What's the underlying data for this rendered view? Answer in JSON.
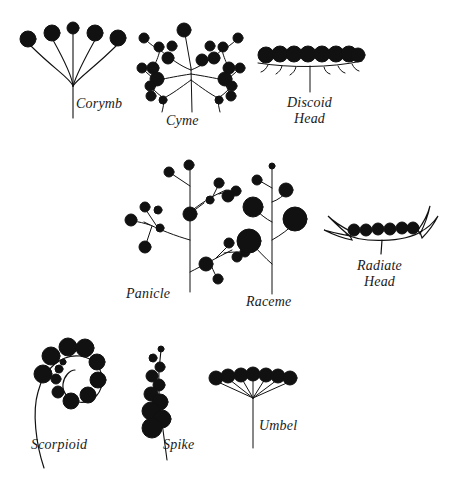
{
  "figure": {
    "width": 459,
    "height": 477,
    "background": "#ffffff",
    "ink": "#111111"
  },
  "labels": {
    "corymb": "Corymb",
    "cyme": "Cyme",
    "discoid_head": "Discoid\nHead",
    "panicle": "Panicle",
    "raceme": "Raceme",
    "radiate_head": "Radiate\nHead",
    "scorpioid": "Scorpioid",
    "spike": "Spike",
    "umbel": "Umbel"
  },
  "diagrams": [
    {
      "name": "corymb",
      "label": "Corymb",
      "description": "Flat-topped cluster; pedicels of unequal length arising at different points along the axis so all flowers reach nearly the same level.",
      "flower_count": 5,
      "axis": {
        "x": 73,
        "y_base": 118,
        "y_top": 78
      },
      "flowers": [
        {
          "cx": 28,
          "cy": 39,
          "r": 8
        },
        {
          "cx": 52,
          "cy": 33,
          "r": 8
        },
        {
          "cx": 73,
          "cy": 28,
          "r": 6
        },
        {
          "cx": 95,
          "cy": 33,
          "r": 8
        },
        {
          "cx": 118,
          "cy": 38,
          "r": 8
        }
      ],
      "pedicels": [
        {
          "x1": 30,
          "y1": 46,
          "x2": 66,
          "y2": 88
        },
        {
          "x1": 53,
          "y1": 41,
          "x2": 71,
          "y2": 74
        },
        {
          "x1": 73,
          "y1": 34,
          "x2": 73,
          "y2": 72
        },
        {
          "x1": 95,
          "y1": 41,
          "x2": 78,
          "y2": 78
        },
        {
          "x1": 117,
          "y1": 45,
          "x2": 80,
          "y2": 92
        }
      ]
    },
    {
      "name": "cyme",
      "label": "Cyme",
      "description": "Determinate cluster; terminal flower opens first and lateral branches repeatedly fork below it.",
      "flower_count": 23,
      "axis": {
        "x": 192,
        "y_base": 105,
        "y_top": 62
      },
      "terminal_flower": {
        "cx": 184,
        "cy": 30,
        "r": 7
      }
    },
    {
      "name": "discoid_head",
      "label": "Discoid Head",
      "description": "Dense head of disc florets only, seated on a flat receptacle subtended by bracts.",
      "floret_count": 10,
      "receptacle": {
        "x1": 259,
        "y1": 64,
        "x2": 361,
        "y2": 62
      },
      "stem": {
        "x": 310,
        "y_top": 64,
        "y_base": 92
      },
      "florets": [
        {
          "cx": 266,
          "cy": 54,
          "r": 8
        },
        {
          "cx": 281,
          "cy": 53,
          "r": 8
        },
        {
          "cx": 296,
          "cy": 53,
          "r": 8
        },
        {
          "cx": 311,
          "cy": 53,
          "r": 8
        },
        {
          "cx": 326,
          "cy": 53,
          "r": 8
        },
        {
          "cx": 341,
          "cy": 53,
          "r": 8
        },
        {
          "cx": 353,
          "cy": 54,
          "r": 8
        }
      ]
    },
    {
      "name": "panicle",
      "label": "Panicle",
      "description": "Branched raceme; each lateral branch bears several stalked flowers.",
      "axis": {
        "x": 190,
        "y_top": 166,
        "y_base": 290
      },
      "branch_count": 4
    },
    {
      "name": "raceme",
      "label": "Raceme",
      "description": "Unbranched elongate axis with stalked flowers; oldest and largest at the base.",
      "axis": {
        "x": 272,
        "y_top": 162,
        "y_base": 292
      },
      "flower_count": 6,
      "flowers": [
        {
          "cx": 272,
          "cy": 166,
          "r": 3
        },
        {
          "cx": 257,
          "cy": 180,
          "r": 5
        },
        {
          "cx": 286,
          "cy": 190,
          "r": 7
        },
        {
          "cx": 253,
          "cy": 207,
          "r": 10
        },
        {
          "cx": 295,
          "cy": 219,
          "r": 12
        },
        {
          "cx": 249,
          "cy": 241,
          "r": 12
        }
      ]
    },
    {
      "name": "radiate_head",
      "label": "Radiate Head",
      "description": "Head with central disc florets surrounded by strap-shaped ray florets at the margins.",
      "disc_floret_count": 7,
      "ray_floret_count": 4,
      "receptacle": {
        "x1": 345,
        "y1": 236,
        "x2": 424,
        "y2": 232
      },
      "stem": {
        "x": 381,
        "y_top": 236,
        "y_base": 252
      },
      "disc_florets": [
        {
          "cx": 355,
          "cy": 228,
          "r": 5
        },
        {
          "cx": 367,
          "cy": 228,
          "r": 5
        },
        {
          "cx": 379,
          "cy": 227,
          "r": 5
        },
        {
          "cx": 391,
          "cy": 227,
          "r": 5
        },
        {
          "cx": 403,
          "cy": 226,
          "r": 5
        },
        {
          "cx": 414,
          "cy": 226,
          "r": 5
        }
      ]
    },
    {
      "name": "scorpioid",
      "label": "Scorpioid",
      "description": "Coiled one-sided cyme; flowers borne along a spiral, largest at the outside and smallest toward the centre.",
      "flower_count": 12,
      "flowers": [
        {
          "cx": 43,
          "cy": 374,
          "r": 9
        },
        {
          "cx": 47,
          "cy": 355,
          "r": 9
        },
        {
          "cx": 63,
          "cy": 345,
          "r": 9
        },
        {
          "cx": 82,
          "cy": 347,
          "r": 9
        },
        {
          "cx": 94,
          "cy": 362,
          "r": 8
        },
        {
          "cx": 96,
          "cy": 380,
          "r": 8
        },
        {
          "cx": 86,
          "cy": 396,
          "r": 7
        },
        {
          "cx": 70,
          "cy": 401,
          "r": 7
        },
        {
          "cx": 58,
          "cy": 392,
          "r": 6
        },
        {
          "cx": 56,
          "cy": 379,
          "r": 5
        },
        {
          "cx": 59,
          "cy": 369,
          "r": 4
        },
        {
          "cx": 62,
          "cy": 362,
          "r": 3
        }
      ]
    },
    {
      "name": "spike",
      "label": "Spike",
      "description": "Unbranched axis bearing sessile flowers without pedicels; largest at the base.",
      "axis": {
        "x": 160,
        "y_top": 348,
        "y_base": 452
      },
      "flower_count": 11,
      "flowers": [
        {
          "cx": 161,
          "cy": 350,
          "r": 3
        },
        {
          "cx": 154,
          "cy": 359,
          "r": 4
        },
        {
          "cx": 160,
          "cy": 368,
          "r": 5
        },
        {
          "cx": 152,
          "cy": 377,
          "r": 6
        },
        {
          "cx": 160,
          "cy": 386,
          "r": 6
        },
        {
          "cx": 152,
          "cy": 395,
          "r": 7
        },
        {
          "cx": 161,
          "cy": 403,
          "r": 8
        },
        {
          "cx": 151,
          "cy": 412,
          "r": 9
        },
        {
          "cx": 163,
          "cy": 420,
          "r": 9
        },
        {
          "cx": 152,
          "cy": 429,
          "r": 10
        }
      ]
    },
    {
      "name": "umbel",
      "label": "Umbel",
      "description": "Pedicels of nearly equal length all radiating from a single point at the top of the axis.",
      "flower_count": 7,
      "hub": {
        "x": 253,
        "y": 396
      },
      "axis": {
        "x": 253,
        "y_top": 396,
        "y_base": 448
      },
      "flowers": [
        {
          "cx": 216,
          "cy": 378,
          "r": 7
        },
        {
          "cx": 228,
          "cy": 376,
          "r": 7
        },
        {
          "cx": 241,
          "cy": 375,
          "r": 7
        },
        {
          "cx": 253,
          "cy": 374,
          "r": 7
        },
        {
          "cx": 266,
          "cy": 375,
          "r": 7
        },
        {
          "cx": 278,
          "cy": 376,
          "r": 7
        },
        {
          "cx": 290,
          "cy": 378,
          "r": 7
        }
      ]
    }
  ],
  "label_positions": {
    "corymb": {
      "left": 76,
      "top": 96
    },
    "cyme": {
      "left": 166,
      "top": 113
    },
    "discoid_head": {
      "left": 287,
      "top": 95
    },
    "panicle": {
      "left": 126,
      "top": 286
    },
    "raceme": {
      "left": 246,
      "top": 294
    },
    "radiate_head": {
      "left": 357,
      "top": 258
    },
    "scorpioid": {
      "left": 31,
      "top": 437
    },
    "spike": {
      "left": 163,
      "top": 437
    },
    "umbel": {
      "left": 259,
      "top": 418
    }
  }
}
